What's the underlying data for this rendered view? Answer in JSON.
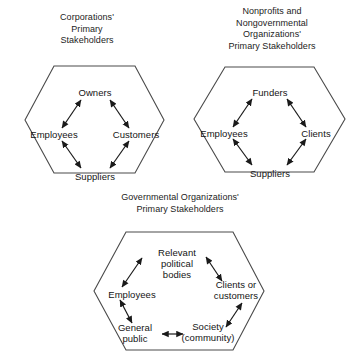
{
  "figure": {
    "background_color": "#ffffff",
    "line_color": "#3a3a3a",
    "text_color": "#1a1a1a"
  },
  "panels": [
    {
      "id": "corporations",
      "title": "Corporations'\nPrimary\nStakeholders",
      "hexagon": {
        "stakeholders": [
          "Owners",
          "Customers",
          "Suppliers",
          "Employees"
        ],
        "arrow_pairs": [
          [
            "Employees",
            "Owners"
          ],
          [
            "Owners",
            "Customers"
          ],
          [
            "Customers",
            "Suppliers"
          ],
          [
            "Suppliers",
            "Employees"
          ]
        ]
      },
      "nodes": {
        "top": "Owners",
        "right": "Customers",
        "bottom": "Suppliers",
        "left": "Employees"
      }
    },
    {
      "id": "nonprofits",
      "title": "Nonprofits and\nNongovernmental\nOrganizations'\nPrimary Stakeholders",
      "hexagon": {
        "stakeholders": [
          "Funders",
          "Clients",
          "Suppliers",
          "Employees"
        ],
        "arrow_pairs": [
          [
            "Employees",
            "Funders"
          ],
          [
            "Funders",
            "Clients"
          ],
          [
            "Clients",
            "Suppliers"
          ],
          [
            "Suppliers",
            "Employees"
          ]
        ]
      },
      "nodes": {
        "top": "Funders",
        "right": "Clients",
        "bottom": "Suppliers",
        "left": "Employees"
      }
    },
    {
      "id": "governmental",
      "title": "Governmental Organizations'\nPrimary Stakeholders",
      "hexagon": {
        "stakeholders": [
          "Relevant political bodies",
          "Clients or customers",
          "Society (community)",
          "General public",
          "Employees"
        ],
        "arrow_pairs": [
          [
            "Employees",
            "Relevant political bodies"
          ],
          [
            "Relevant political bodies",
            "Clients or customers"
          ],
          [
            "Clients or customers",
            "Society (community)"
          ],
          [
            "Society (community)",
            "General public"
          ],
          [
            "General public",
            "Employees"
          ]
        ]
      },
      "nodes": {
        "top": "Relevant\npolitical\nbodies",
        "upper_right": "Clients or\ncustomers",
        "lower_right": "Society\n(community)",
        "lower_left": "General\npublic",
        "left": "Employees"
      }
    }
  ]
}
